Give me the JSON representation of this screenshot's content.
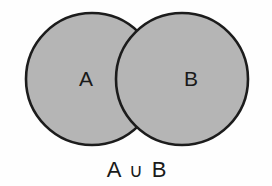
{
  "figure": {
    "background_color": "#fefefe",
    "fill_color": "#b5b5b5",
    "outline_color": "#1c1c1c"
  },
  "sets": [
    {
      "id": "A",
      "label": "A",
      "label_x": 86,
      "label_y": 80,
      "center_x": 92,
      "center_y": 79,
      "radius": 66
    },
    {
      "id": "B",
      "label": "B",
      "label_x": 191,
      "label_y": 80,
      "center_x": 182,
      "center_y": 79,
      "radius": 66
    }
  ],
  "caption": {
    "full_text": "A ∪ B",
    "left_operand": "A",
    "operator": "∪",
    "operator_name": "union",
    "right_operand": "B",
    "x": 136,
    "y": 171
  },
  "regions": {
    "a_only_shaded": true,
    "b_only_shaded": true,
    "intersection_shaded": true,
    "shaded_meaning": "A ∪ B"
  }
}
